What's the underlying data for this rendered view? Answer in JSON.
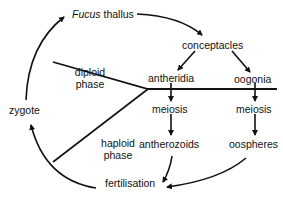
{
  "diagram": {
    "nodes": {
      "thallus_italic": "Fucus",
      "thallus_rest": " thallus",
      "conceptacles": "conceptacles",
      "antheridia": "antheridia",
      "oogonia": "oogonia",
      "meiosis_left": "meiosis",
      "meiosis_right": "meiosis",
      "antherozoids": "antherozoids",
      "oospheres": "oospheres",
      "fertilisation": "fertilisation",
      "zygote": "zygote"
    },
    "regions": {
      "diploid_1": "diploid",
      "diploid_2": "phase",
      "haploid_1": "haploid",
      "haploid_2": "phase"
    }
  }
}
